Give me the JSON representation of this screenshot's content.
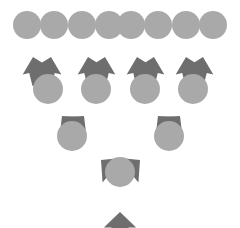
{
  "diagram": {
    "type": "binary-tree",
    "orientation": "bottom-up",
    "levels": 4,
    "node_shape": "circle",
    "edge_shape": "block-arrow",
    "colors": {
      "background": "#ffffff",
      "node_fill": "#a9a9a9",
      "arrow_fill": "#6e6e6e"
    },
    "counts": {
      "level_1_nodes": 1,
      "level_2_nodes": 2,
      "level_3_nodes": 4,
      "level_4_nodes": 8,
      "total_nodes": 15,
      "total_arrows": 14
    },
    "nodes": [
      {
        "id": "n0",
        "level": 1,
        "cx": 120,
        "cy": 172,
        "r": 15
      },
      {
        "id": "n1",
        "level": 2,
        "cx": 72,
        "cy": 136,
        "r": 15
      },
      {
        "id": "n2",
        "level": 2,
        "cx": 169,
        "cy": 136,
        "r": 15
      },
      {
        "id": "n3",
        "level": 3,
        "cx": 48,
        "cy": 89,
        "r": 15
      },
      {
        "id": "n4",
        "level": 3,
        "cx": 96,
        "cy": 89,
        "r": 15
      },
      {
        "id": "n5",
        "level": 3,
        "cx": 145,
        "cy": 89,
        "r": 15
      },
      {
        "id": "n6",
        "level": 3,
        "cx": 193,
        "cy": 89,
        "r": 15
      },
      {
        "id": "n7",
        "level": 4,
        "cx": 27,
        "cy": 25,
        "r": 14
      },
      {
        "id": "n8",
        "level": 4,
        "cx": 54,
        "cy": 25,
        "r": 14
      },
      {
        "id": "n9",
        "level": 4,
        "cx": 82,
        "cy": 25,
        "r": 14
      },
      {
        "id": "n10",
        "level": 4,
        "cx": 109,
        "cy": 25,
        "r": 14
      },
      {
        "id": "n11",
        "level": 4,
        "cx": 131,
        "cy": 25,
        "r": 14
      },
      {
        "id": "n12",
        "level": 4,
        "cx": 158,
        "cy": 25,
        "r": 14
      },
      {
        "id": "n13",
        "level": 4,
        "cx": 186,
        "cy": 25,
        "r": 14
      },
      {
        "id": "n14",
        "level": 4,
        "cx": 213,
        "cy": 25,
        "r": 14
      }
    ],
    "arrows": [
      {
        "id": "a-root-in",
        "from": "external",
        "to": "n0",
        "x": 120,
        "y": 212,
        "angle": 0,
        "len": 30,
        "w": 17
      },
      {
        "id": "a0-1",
        "from": "n0",
        "to": "n1",
        "x": 101,
        "y": 160,
        "angle": -50,
        "len": 30,
        "w": 17
      },
      {
        "id": "a0-2",
        "from": "n0",
        "to": "n2",
        "x": 140,
        "y": 160,
        "angle": 50,
        "len": 30,
        "w": 17
      },
      {
        "id": "a1-3",
        "from": "n1",
        "to": "n3",
        "x": 62,
        "y": 116,
        "angle": -40,
        "len": 24,
        "w": 14
      },
      {
        "id": "a1-4",
        "from": "n1",
        "to": "n4",
        "x": 84,
        "y": 116,
        "angle": 40,
        "len": 24,
        "w": 14
      },
      {
        "id": "a2-5",
        "from": "n2",
        "to": "n5",
        "x": 158,
        "y": 116,
        "angle": -40,
        "len": 24,
        "w": 14
      },
      {
        "id": "a2-6",
        "from": "n2",
        "to": "n6",
        "x": 180,
        "y": 116,
        "angle": 40,
        "len": 24,
        "w": 14
      },
      {
        "id": "a3-7",
        "from": "n3",
        "to": "n7",
        "x": 33,
        "y": 57,
        "angle": -14,
        "len": 28,
        "w": 15
      },
      {
        "id": "a3-8",
        "from": "n3",
        "to": "n8",
        "x": 51,
        "y": 57,
        "angle": 14,
        "len": 28,
        "w": 15
      },
      {
        "id": "a4-9",
        "from": "n4",
        "to": "n9",
        "x": 88,
        "y": 57,
        "angle": -14,
        "len": 28,
        "w": 15
      },
      {
        "id": "a4-10",
        "from": "n4",
        "to": "n10",
        "x": 105,
        "y": 57,
        "angle": 14,
        "len": 28,
        "w": 15
      },
      {
        "id": "a5-11",
        "from": "n5",
        "to": "n11",
        "x": 137,
        "y": 57,
        "angle": -14,
        "len": 28,
        "w": 15
      },
      {
        "id": "a5-12",
        "from": "n5",
        "to": "n12",
        "x": 154,
        "y": 57,
        "angle": 14,
        "len": 28,
        "w": 15
      },
      {
        "id": "a6-13",
        "from": "n6",
        "to": "n13",
        "x": 186,
        "y": 57,
        "angle": -14,
        "len": 28,
        "w": 15
      },
      {
        "id": "a6-14",
        "from": "n6",
        "to": "n14",
        "x": 203,
        "y": 57,
        "angle": 14,
        "len": 28,
        "w": 15
      }
    ]
  }
}
